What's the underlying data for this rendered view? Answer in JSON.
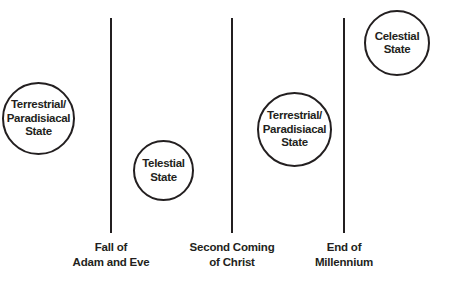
{
  "diagram": {
    "title": "",
    "stroke_color": "#231f20",
    "states": [
      {
        "id": "terrestrial-1",
        "lines": [
          "Terrestrial/",
          "Paradisiacal",
          "State"
        ]
      },
      {
        "id": "telestial",
        "lines": [
          "Telestial",
          "State"
        ]
      },
      {
        "id": "terrestrial-2",
        "lines": [
          "Terrestrial/",
          "Paradisiacal",
          "State"
        ]
      },
      {
        "id": "celestial",
        "lines": [
          "Celestial",
          "State"
        ]
      }
    ],
    "dividers": [
      {
        "id": "fall",
        "lines": [
          "Fall of",
          "Adam and Eve"
        ]
      },
      {
        "id": "second-coming",
        "lines": [
          "Second Coming",
          "of Christ"
        ]
      },
      {
        "id": "end-millennium",
        "lines": [
          "End of",
          "Millennium"
        ]
      }
    ]
  }
}
